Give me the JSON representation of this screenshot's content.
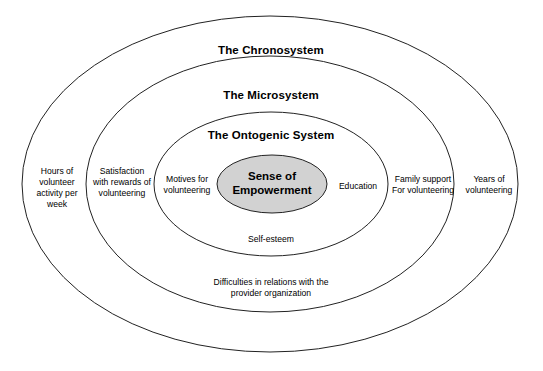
{
  "diagram": {
    "title_chronosystem": "The Chronosystem",
    "title_microsystem": "The Microsystem",
    "title_ontogenic": "The Ontogenic System",
    "core": "Sense of\nEmpowerment",
    "colors": {
      "core_fill": "#d2d2d2",
      "stroke": "#222222",
      "background": "#ffffff",
      "text": "#000000"
    },
    "rings": [
      {
        "name": "chronosystem",
        "title": "The Chronosystem",
        "items": [
          {
            "name": "hours-of-volunteer-activity",
            "text": "Hours of\nvolunteer\nactivity per\nweek"
          },
          {
            "name": "years-of-volunteering",
            "text": "Years of\nvolunteering"
          }
        ]
      },
      {
        "name": "microsystem",
        "title": "The Microsystem",
        "items": [
          {
            "name": "satisfaction-with-rewards",
            "text": "Satisfaction\nwith rewards of\nvolunteering"
          },
          {
            "name": "family-support",
            "text": "Family support\nFor volunteering"
          },
          {
            "name": "difficulties-in-relations",
            "text": "Difficulties in relations with the\nprovider organization"
          }
        ]
      },
      {
        "name": "ontogenic",
        "title": "The Ontogenic System",
        "items": [
          {
            "name": "motives-for-volunteering",
            "text": "Motives for\nvolunteering"
          },
          {
            "name": "education",
            "text": "Education"
          },
          {
            "name": "self-esteem",
            "text": "Self-esteem"
          }
        ]
      }
    ],
    "labels": {
      "hours_of_volunteer": "Hours of\nvolunteer\nactivity per\nweek",
      "satisfaction_rewards": "Satisfaction\nwith rewards of\nvolunteering",
      "motives_for_volunteering": "Motives for\nvolunteering",
      "education": "Education",
      "family_support": "Family support\nFor volunteering",
      "years_of_volunteering": "Years of\nvolunteering",
      "self_esteem": "Self-esteem",
      "difficulties": "Difficulties in relations with the\nprovider organization"
    }
  }
}
